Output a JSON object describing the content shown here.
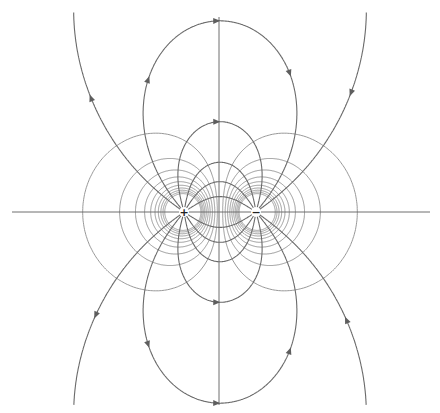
{
  "diagram": {
    "width": 440,
    "height": 413,
    "colors": {
      "background": "#ffffff",
      "field_line": "#6a6a6a",
      "equipotential": "#8c8c8c",
      "axis": "#6e6e6e",
      "arrow": "#5e5e5e"
    },
    "axes": {
      "horizontal": {
        "x1": 12,
        "y1": 212,
        "x2": 430,
        "y2": 212
      },
      "vertical": {
        "x1": 219,
        "y1": 17,
        "x2": 219,
        "y2": 405
      }
    },
    "charges": [
      {
        "label": "+",
        "sign": 1,
        "x": 184,
        "y": 212
      },
      {
        "label": "−",
        "sign": -1,
        "x": 256,
        "y": 212
      }
    ],
    "field_lines": {
      "start_angles_deg": [
        144,
        129,
        105,
        80,
        58,
        33
      ],
      "arrow_on": [
        true,
        true,
        true,
        false,
        false,
        false
      ],
      "mirror_below_axis": true
    },
    "equipotentials": {
      "potential_step": 0.0041,
      "levels": [
        1,
        2,
        3,
        4,
        5,
        6,
        7,
        8,
        9,
        10
      ],
      "both_signs": true
    }
  }
}
